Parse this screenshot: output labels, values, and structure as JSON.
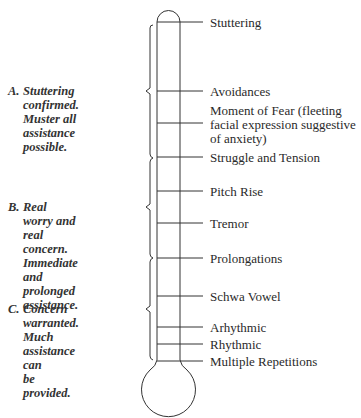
{
  "diagram": {
    "type": "thermometer-scale",
    "levels": [
      {
        "label": "Stuttering"
      },
      {
        "label": "Avoidances"
      },
      {
        "label": "Moment of Fear (fleeting\nfacial expression suggestive\nof anxiety)"
      },
      {
        "label": "Struggle and Tension"
      },
      {
        "label": "Pitch Rise"
      },
      {
        "label": "Tremor"
      },
      {
        "label": "Prolongations"
      },
      {
        "label": "Schwa Vowel"
      },
      {
        "label": "Arhythmic"
      },
      {
        "label": "Rhythmic"
      },
      {
        "label": "Multiple Repetitions"
      }
    ],
    "groups": [
      {
        "letter": "A.",
        "text": "Stuttering confirmed.\nMuster all assistance\npossible."
      },
      {
        "letter": "B.",
        "text": "Real worry and real\nconcern. Immediate\nand prolonged\nassistance."
      },
      {
        "letter": "C.",
        "text": "Concern warranted.\nMuch assistance can\nbe provided."
      }
    ]
  }
}
